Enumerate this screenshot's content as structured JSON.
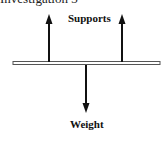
{
  "heading": {
    "text": "Investigation 3"
  },
  "labels": {
    "supports": "Supports",
    "weight": "Weight"
  },
  "beam": {
    "x1": 13,
    "x2": 160,
    "y": 63,
    "color": "#555555"
  },
  "forces": [
    {
      "name": "left-support",
      "direction": "up",
      "x": 49,
      "y_from": 62,
      "y_to": 14
    },
    {
      "name": "right-support",
      "direction": "up",
      "x": 122,
      "y_from": 62,
      "y_to": 14
    },
    {
      "name": "weight",
      "direction": "down",
      "x": 86,
      "y_from": 65,
      "y_to": 113
    }
  ],
  "colors": {
    "arrow": "#111111",
    "beam": "#555555",
    "background": "#ffffff"
  }
}
